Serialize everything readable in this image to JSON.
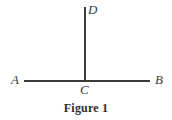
{
  "figure": {
    "caption": "Figure 1",
    "background_color": "#ffffff",
    "stroke_color": "#3b3b3b",
    "label_color": "#3b3b3b",
    "labels": {
      "A": "A",
      "B": "B",
      "C": "C",
      "D": "D"
    }
  },
  "chart_data": {
    "type": "diagram",
    "title": "Figure 1",
    "xlabel": "",
    "ylabel": "",
    "grid": false,
    "legend": "none",
    "points": [
      {
        "id": "A",
        "label": "A",
        "x": 24,
        "y": 81
      },
      {
        "id": "B",
        "label": "B",
        "x": 150,
        "y": 81
      },
      {
        "id": "C",
        "label": "C",
        "x": 85,
        "y": 81
      },
      {
        "id": "D",
        "label": "D",
        "x": 85,
        "y": 7
      }
    ],
    "segments": [
      {
        "name": "AB",
        "from": "A",
        "to": "B",
        "x1": 24,
        "y1": 81,
        "x2": 150,
        "y2": 81,
        "stroke_width": 2
      },
      {
        "name": "CD",
        "from": "C",
        "to": "D",
        "x1": 85,
        "y1": 81,
        "x2": 85,
        "y2": 7,
        "stroke_width": 2
      }
    ],
    "angles": [
      {
        "name": "ACD",
        "vertex": "C",
        "degrees": 90
      },
      {
        "name": "DCB",
        "vertex": "C",
        "degrees": 90
      }
    ]
  }
}
